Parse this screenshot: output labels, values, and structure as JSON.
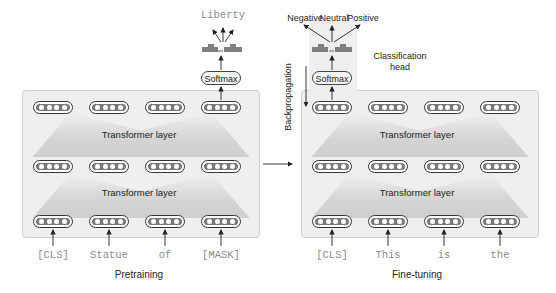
{
  "pretraining": {
    "caption": "Pretraining",
    "layers": [
      {
        "label": "Transformer layer"
      },
      {
        "label": "Transformer layer"
      }
    ],
    "tokens": [
      "[CLS]",
      "Statue",
      "of",
      "[MASK]"
    ],
    "softmax_label": "Softmax",
    "output_label": "Liberty"
  },
  "finetuning": {
    "caption": "Fine-tuning",
    "layers": [
      {
        "label": "Transformer layer"
      },
      {
        "label": "Transformer layer"
      }
    ],
    "tokens": [
      "[CLS]",
      "This",
      "is",
      "the"
    ],
    "softmax_label": "Softmax",
    "output_labels": [
      "Negative",
      "Neutral",
      "Positive"
    ],
    "head_label_line1": "Classification",
    "head_label_line2": "head",
    "backprop_label": "Backpropagation"
  },
  "colors": {
    "panel_bg": "#efefef",
    "panel_border": "#cfcfcf",
    "layer_shade": "#d6d6d6",
    "vector_fill": "#7a7a7a",
    "histogram": "#7f7f7f",
    "token_text": "#8a8a8a"
  }
}
